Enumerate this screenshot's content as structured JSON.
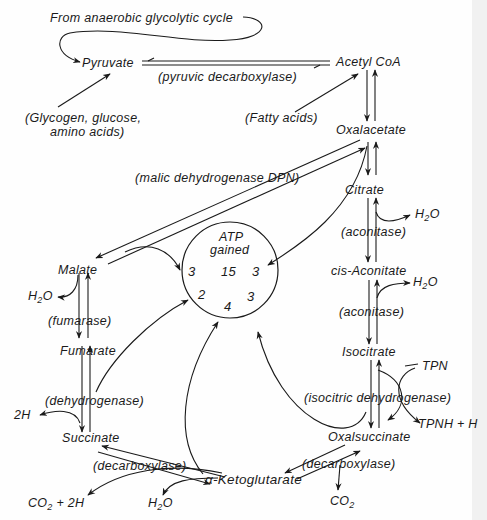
{
  "diagram": {
    "type": "metabolic-cycle",
    "colors": {
      "ink": "#1a1a1a",
      "paper": "#fefefe",
      "edge": "#f1f1f1"
    },
    "sources": {
      "glycolytic": "From anaerobic glycolytic cycle",
      "glycogen_line1": "(Glycogen, glucose,",
      "glycogen_line2": "amino acids)",
      "fatty_acids": "(Fatty acids)"
    },
    "compounds": {
      "pyruvate": "Pyruvate",
      "acetyl_coa": "Acetyl CoA",
      "oxalacetate": "Oxalacetate",
      "citrate": "Citrate",
      "cis_aconitate": "cis-Aconitate",
      "isocitrate": "Isocitrate",
      "oxalsuccinate": "Oxalsuccinate",
      "ketoglutarate": "α-Ketoglutarate",
      "succinate": "Succinate",
      "fumarate": "Fumarate",
      "malate": "Malate"
    },
    "enzymes": {
      "pyruvic_decarboxylase": "(pyruvic decarboxylase)",
      "malic_dehydrogenase": "(malic dehydrogenase DPN)",
      "aconitase_1": "(aconitase)",
      "aconitase_2": "(aconitase)",
      "isocitric_dehydrogenase": "(isocitric dehydrogenase)",
      "decarboxylase_right": "(decarboxylase)",
      "decarboxylase_left": "(decarboxylase)",
      "dehydrogenase": "(dehydrogenase)",
      "fumarase": "(fumarase)"
    },
    "byproducts": {
      "h2o_citrate": "H",
      "h2o_aconitate": "H",
      "h2o_malate": "H",
      "h2o_keto": "H",
      "tpn": "TPN",
      "tpnh": "TPNH + H",
      "co2_right": "CO",
      "co2_left": "CO",
      "co2_left_suffix": " + 2H",
      "two_h": "2H",
      "sub_2": "2",
      "o": "O"
    },
    "atp_circle": {
      "title_line1": "ATP",
      "title_line2": "gained",
      "total": "15",
      "from_malate": "3",
      "from_oxalacetate": "3",
      "from_succinate": "2",
      "from_ketoglutarate": "4",
      "from_isocitrate": "3"
    }
  }
}
